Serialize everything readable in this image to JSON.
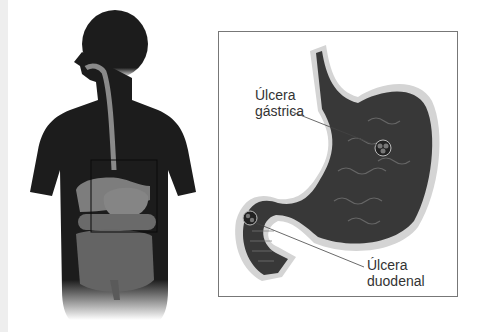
{
  "figure": {
    "left_panel": "human-torso-silhouette-digestive-system",
    "inset_highlight": "stomach-region-box",
    "right_panel": "stomach-duodenum-cross-section"
  },
  "labels": {
    "gastric_ulcer_line1": "Úlcera",
    "gastric_ulcer_line2": "gástrica",
    "duodenal_ulcer_line1": "Úlcera",
    "duodenal_ulcer_line2": "duodenal"
  },
  "colors": {
    "silhouette": "#1c1c1c",
    "organs": "#7a7a7a",
    "stomach_dark": "#2a2a2a",
    "stomach_rim": "#d8d8d8",
    "frame": "#777777"
  }
}
